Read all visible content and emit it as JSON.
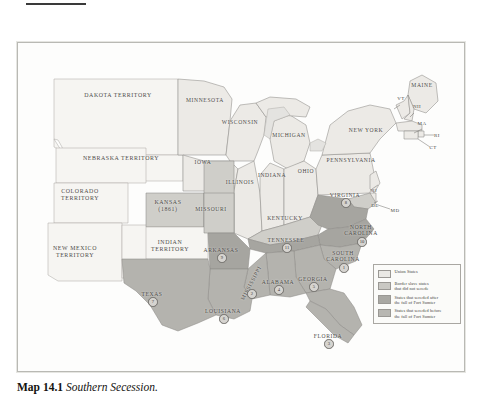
{
  "caption": {
    "number": "Map 14.1",
    "title": "Southern Secession."
  },
  "legend": {
    "items": [
      {
        "label": "Union States",
        "color": "#e9e8e4"
      },
      {
        "label": "Border slave states\nthat did not secede",
        "color": "#c9c8c3"
      },
      {
        "label": "States that seceded after\nthe fall of Fort Sumter",
        "color": "#a9a8a3"
      },
      {
        "label": "States that seceded before\nthe fall of Fort Sumter",
        "color": "#b8b7b2"
      }
    ]
  },
  "colors": {
    "union": "#eceae6",
    "border_slave": "#cfcec9",
    "seceded_after": "#a6a5a0",
    "seceded_before": "#b4b3ae",
    "territory": "#f6f5f2",
    "water": "#f2f1ee",
    "outline": "#8d8b87",
    "label": "#4c4a47"
  },
  "territories": [
    {
      "name": "DAKOTA TERRITORY",
      "x": 100,
      "y": 52
    },
    {
      "name": "NEBRASKA TERRITORY",
      "x": 103,
      "y": 115
    },
    {
      "name": "COLORADO\nTERRITORY",
      "x": 62,
      "y": 152
    },
    {
      "name": "NEW MEXICO\nTERRITORY",
      "x": 57,
      "y": 209
    },
    {
      "name": "INDIAN\nTERRITORY",
      "x": 152,
      "y": 203
    },
    {
      "name": "KANSAS\n(1861)",
      "x": 150,
      "y": 163
    }
  ],
  "states": [
    {
      "name": "MINNESOTA",
      "x": 187,
      "y": 57,
      "number": null
    },
    {
      "name": "WISCONSIN",
      "x": 222,
      "y": 79,
      "number": null
    },
    {
      "name": "MICHIGAN",
      "x": 271,
      "y": 92,
      "number": null
    },
    {
      "name": "IOWA",
      "x": 185,
      "y": 119,
      "number": null
    },
    {
      "name": "ILLINOIS",
      "x": 222,
      "y": 139,
      "number": null
    },
    {
      "name": "INDIANA",
      "x": 254,
      "y": 132,
      "number": null
    },
    {
      "name": "OHIO",
      "x": 288,
      "y": 128,
      "number": null
    },
    {
      "name": "MISSOURI",
      "x": 193,
      "y": 166,
      "number": null
    },
    {
      "name": "KENTUCKY",
      "x": 267,
      "y": 175,
      "number": null
    },
    {
      "name": "PENNSYLVANIA",
      "x": 333,
      "y": 117,
      "number": null
    },
    {
      "name": "NEW YORK",
      "x": 348,
      "y": 87,
      "number": null
    },
    {
      "name": "MAINE",
      "x": 404,
      "y": 42,
      "number": null
    },
    {
      "name": "VIRGINIA",
      "x": 327,
      "y": 152,
      "number": "8"
    },
    {
      "name": "NORTH\nCAROLINA",
      "x": 343,
      "y": 187,
      "number": "10"
    },
    {
      "name": "SOUTH\nCAROLINA",
      "x": 325,
      "y": 213,
      "number": "1"
    },
    {
      "name": "GEORGIA",
      "x": 295,
      "y": 236,
      "number": "5"
    },
    {
      "name": "TENNESSEE",
      "x": 268,
      "y": 197,
      "number": "11"
    },
    {
      "name": "ALABAMA",
      "x": 260,
      "y": 239,
      "number": "4"
    },
    {
      "name": "MISSISSIPPI",
      "x": 233,
      "y": 240,
      "number": "2",
      "rotated": true
    },
    {
      "name": "ARKANSAS",
      "x": 203,
      "y": 207,
      "number": "9"
    },
    {
      "name": "LOUISIANA",
      "x": 205,
      "y": 268,
      "number": "6"
    },
    {
      "name": "TEXAS",
      "x": 134,
      "y": 251,
      "number": "7"
    },
    {
      "name": "FLORIDA",
      "x": 310,
      "y": 293,
      "number": "3"
    }
  ],
  "abbreviations": [
    {
      "name": "VT",
      "x": 383,
      "y": 56
    },
    {
      "name": "NH",
      "x": 399,
      "y": 64
    },
    {
      "name": "MA",
      "x": 404,
      "y": 81
    },
    {
      "name": "RI",
      "x": 419,
      "y": 93
    },
    {
      "name": "CT",
      "x": 415,
      "y": 105
    },
    {
      "name": "NJ",
      "x": 356,
      "y": 148
    },
    {
      "name": "DE",
      "x": 357,
      "y": 163
    },
    {
      "name": "MD",
      "x": 377,
      "y": 168
    }
  ]
}
